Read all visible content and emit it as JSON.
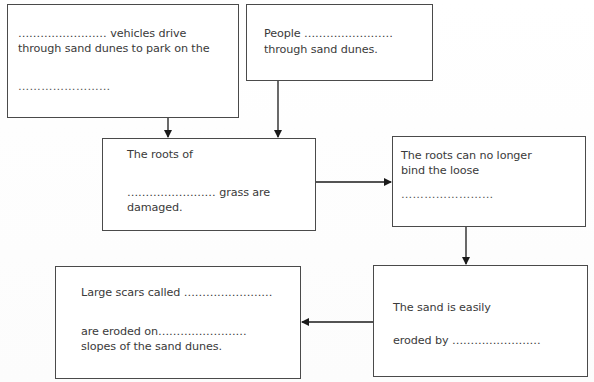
{
  "diagram": {
    "type": "flowchart",
    "blank": "……………………",
    "boxes": [
      {
        "id": "vehicles",
        "lines": [
          "…………………… vehicles drive",
          "through sand dunes to park on the",
          "……………………"
        ]
      },
      {
        "id": "people",
        "lines": [
          "People ……………………",
          "through sand dunes."
        ]
      },
      {
        "id": "roots",
        "lines": [
          "The roots of",
          "…………………… grass are",
          "damaged."
        ]
      },
      {
        "id": "bind",
        "lines": [
          "The roots can no longer",
          "bind the loose",
          "……………………"
        ]
      },
      {
        "id": "eroded",
        "lines": [
          "The sand is easily",
          "eroded by ……………………"
        ]
      },
      {
        "id": "scars",
        "lines": [
          "Large scars called ……………………",
          "are eroded on……………………",
          "slopes of the sand dunes."
        ]
      }
    ],
    "arrows": [
      {
        "from": "vehicles",
        "to": "roots",
        "direction": "down"
      },
      {
        "from": "people",
        "to": "roots",
        "direction": "down"
      },
      {
        "from": "roots",
        "to": "bind",
        "direction": "right"
      },
      {
        "from": "bind",
        "to": "eroded",
        "direction": "down"
      },
      {
        "from": "eroded",
        "to": "scars",
        "direction": "left"
      }
    ],
    "colors": {
      "border": "#4a4a4a",
      "text": "#3a3a3a",
      "arrow": "#1a1a1a",
      "background": "#ffffff"
    }
  }
}
